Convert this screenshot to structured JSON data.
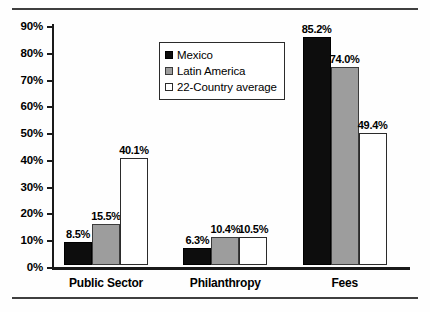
{
  "chart_data": {
    "type": "bar",
    "title": "",
    "subtitle": "",
    "xlabel": "",
    "ylabel": "",
    "categories": [
      "Public Sector",
      "Philanthropy",
      "Fees"
    ],
    "series": [
      {
        "name": "Mexico",
        "color": "#0d0d0d",
        "values": [
          8.5,
          6.3,
          85.2
        ],
        "labels": [
          "8.5%",
          "6.3%",
          "85.2%"
        ]
      },
      {
        "name": "Latin America",
        "color": "#9d9d9d",
        "values": [
          15.5,
          10.4,
          74.0
        ],
        "labels": [
          "15.5%",
          "10.4%",
          "74.0%"
        ]
      },
      {
        "name": "22-Country average",
        "color": "#ffffff",
        "values": [
          40.1,
          10.5,
          49.4
        ],
        "labels": [
          "40.1%",
          "10.5%",
          "49.4%"
        ]
      }
    ],
    "ylim": [
      0,
      90
    ],
    "yticks": [
      0,
      10,
      20,
      30,
      40,
      50,
      60,
      70,
      80,
      90
    ],
    "ytick_labels": [
      "0%",
      "10%",
      "20%",
      "30%",
      "40%",
      "50%",
      "60%",
      "70%",
      "80%",
      "90%"
    ],
    "grid": false,
    "legend_position": "upper-center",
    "legend_entries": [
      "Mexico",
      "Latin America",
      "22-Country average"
    ]
  },
  "axis": {
    "y_labels": [
      "90%",
      "80%",
      "70%",
      "60%",
      "50%",
      "40%",
      "30%",
      "20%",
      "10%",
      "0%"
    ]
  },
  "legend": {
    "items": [
      {
        "label": "Mexico"
      },
      {
        "label": "Latin America"
      },
      {
        "label": "22-Country average"
      }
    ]
  },
  "categories": [
    {
      "label": "Public Sector"
    },
    {
      "label": "Philanthropy"
    },
    {
      "label": "Fees"
    }
  ],
  "bar_labels": {
    "public_sector": [
      "8.5%",
      "15.5%",
      "40.1%"
    ],
    "philanthropy": [
      "6.3%",
      "10.4%",
      "10.5%"
    ],
    "fees": [
      "85.2%",
      "74.0%",
      "49.4%"
    ]
  }
}
